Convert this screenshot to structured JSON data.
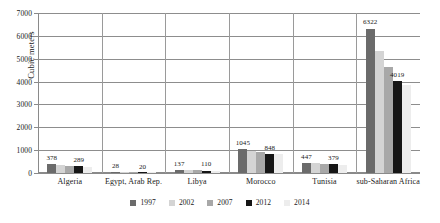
{
  "chart_data": {
    "type": "bar",
    "title": "",
    "xlabel": "",
    "ylabel": "Cubic meters",
    "ylim": [
      0,
      7000
    ],
    "ytick_step": 1000,
    "yticks": [
      "0",
      "1000",
      "2000",
      "3000",
      "4000",
      "5000",
      "6000",
      "7000"
    ],
    "grid": true,
    "legend_position": "bottom",
    "categories": [
      "Algeria",
      "Egypt, Arab Rep.",
      "Libya",
      "Morocco",
      "Tunisia",
      "sub-Saharan Africa"
    ],
    "series": [
      {
        "name": "1997",
        "color": "#6b6b6b",
        "values": [
          378,
          28,
          137,
          1045,
          447,
          6322
        ]
      },
      {
        "name": "2002",
        "color": "#d4d4d4",
        "values": [
          330,
          25,
          120,
          960,
          420,
          5350
        ]
      },
      {
        "name": "2007",
        "color": "#a8a8a8",
        "values": [
          305,
          22,
          112,
          900,
          400,
          4660
        ]
      },
      {
        "name": "2012",
        "color": "#161616",
        "values": [
          289,
          20,
          110,
          848,
          379,
          4019
        ]
      },
      {
        "name": "2014",
        "color": "#ededed",
        "values": [
          282,
          19,
          106,
          830,
          370,
          3860
        ]
      }
    ],
    "data_labels": [
      {
        "category": "Algeria",
        "series": "1997",
        "text": "378"
      },
      {
        "category": "Algeria",
        "series": "2012",
        "text": "289"
      },
      {
        "category": "Egypt, Arab Rep.",
        "series": "1997",
        "text": "28"
      },
      {
        "category": "Egypt, Arab Rep.",
        "series": "2012",
        "text": "20"
      },
      {
        "category": "Libya",
        "series": "1997",
        "text": "137"
      },
      {
        "category": "Libya",
        "series": "2012",
        "text": "110"
      },
      {
        "category": "Morocco",
        "series": "1997",
        "text": "1045"
      },
      {
        "category": "Morocco",
        "series": "2012",
        "text": "848"
      },
      {
        "category": "Tunisia",
        "series": "1997",
        "text": "447"
      },
      {
        "category": "Tunisia",
        "series": "2012",
        "text": "379"
      },
      {
        "category": "sub-Saharan Africa",
        "series": "1997",
        "text": "6322"
      },
      {
        "category": "sub-Saharan Africa",
        "series": "2012",
        "text": "4019"
      }
    ]
  },
  "axis": {
    "ylabel": "Cubic meters"
  }
}
